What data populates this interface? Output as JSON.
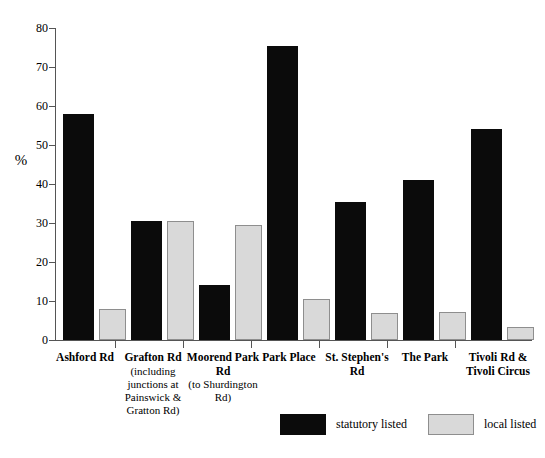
{
  "chart_data": {
    "type": "bar",
    "title": "",
    "subtitle": "",
    "xlabel": "",
    "ylabel": "%",
    "ylim": [
      0,
      80
    ],
    "ytick_values": [
      0,
      10,
      20,
      30,
      40,
      50,
      60,
      70,
      80
    ],
    "ytick_labels": [
      "0",
      "10",
      "20",
      "30",
      "40",
      "50",
      "60",
      "70",
      "80"
    ],
    "grid": false,
    "legend_position": "bottom",
    "categories": [
      "Ashford Rd",
      "Grafton Rd (including junctions at Painswick & Gratton Rd)",
      "Moorend Park Rd (to Shurdington Rd)",
      "Park Place",
      "St. Stephen's Rd",
      "The Park",
      "Tivoli Rd & Tivoli Circus"
    ],
    "series": [
      {
        "name": "statutory listed",
        "color": "#0b0b0b",
        "values": [
          58,
          30.5,
          14.2,
          75.5,
          35.5,
          41,
          54
        ]
      },
      {
        "name": "local listed",
        "color": "#d9d9d9",
        "values": [
          8,
          30.5,
          29.5,
          10.5,
          6.8,
          7.3,
          3.3
        ]
      }
    ]
  },
  "axis": {
    "y_title": "%",
    "y_ticks": [
      "80",
      "70",
      "60",
      "50",
      "40",
      "30",
      "20",
      "10",
      "0"
    ]
  },
  "categories_display": [
    {
      "main": "Ashford Rd",
      "sub": ""
    },
    {
      "main": "Grafton Rd",
      "sub": "(including junctions at Painswick & Gratton Rd)"
    },
    {
      "main": "Moorend Park Rd",
      "sub": "(to Shurdington Rd)"
    },
    {
      "main": "Park Place",
      "sub": ""
    },
    {
      "main": "St. Stephen's Rd",
      "sub": ""
    },
    {
      "main": "The Park",
      "sub": ""
    },
    {
      "main": "Tivoli Rd & Tivoli Circus",
      "sub": ""
    }
  ],
  "legend": {
    "statutory_label": "statutory listed",
    "local_label": "local listed",
    "statutory_color": "#0b0b0b",
    "local_color": "#d9d9d9"
  }
}
